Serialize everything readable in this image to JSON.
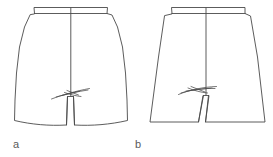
{
  "figure": {
    "type": "technical-flat-line-drawing",
    "background_color": "#ffffff",
    "line_color": "#4a4a4a",
    "line_width": 0.9,
    "width": 273,
    "height": 157
  },
  "diagram_data": {
    "type": "line-drawing",
    "title": "",
    "panels": [
      {
        "id": "a",
        "label": "a",
        "name": "straight-shorts",
        "description": "Shorts with gently curved outward side seams, straight parallel inseams and slightly curved hems",
        "label_x": 13,
        "label_y": 139,
        "outline": "M 34.5 13.5 L 34.0 7.5 L 107.5 7.5 L 107.0 13.5 L 112.0 15.0 L 117.5 27.0 L 122.5 47.0 L 125.5 73.0 L 127.0 100.0 L 127.5 120.5 C 110.0 124.5 92.0 126.0 74.5 125.0 L 73.5 96.5 L 67.5 96.5 L 66.5 125.0 C 49.0 126.0 31.5 124.5 14.5 120.5 L 15.0 100.0 L 16.5 73.0 L 19.5 47.0 L 24.5 27.0 L 30.0 15.0 Z",
        "waistband_line": "M 34.5 13.5 L 107.0 13.5",
        "center_seam": "M 70.8 8.0 L 70.8 96.0",
        "inseam_left": "M 67.5 96.5 L 66.5 125.0",
        "inseam_right": "M 73.5 96.5 L 74.5 125.0",
        "hem_left": "M 14.5 120.5 C 32.0 124.8 49.0 126.2 66.5 125.0",
        "hem_right": "M 74.5 125.0 C 92.0 126.2 110.0 124.8 127.5 120.5",
        "crotch_marks": [
          "M 51.5 99.0 C 62.0 95.0 76.0 91.0 89.5 88.5",
          "M 56.0 97.0 C 66.0 94.0 78.0 91.5 88.0 90.0",
          "M 62.0 95.5 L 80.0 91.0",
          "M 64.5 92.5 C 70.0 94.5 76.0 96.0 81.0 96.5",
          "M 67.0 90.5 L 78.5 95.0"
        ]
      },
      {
        "id": "b",
        "label": "b",
        "name": "a-line-flared-shorts",
        "description": "A-line shorts with straight side seams flaring outward, V-shaped diverging inseams and straight hems",
        "label_x": 135,
        "label_y": 139,
        "outline": "M 172.0 13.5 L 171.5 7.5 L 245.0 7.5 L 245.0 13.5 L 250.5 16.0 L 257.5 57.0 L 265.0 122.0 L 205.5 122.0 L 209.0 95.5 L 203.0 95.5 L 198.5 122.0 L 150.0 122.0 L 158.5 57.0 L 164.5 16.0 Z",
        "waistband_line": "M 172.0 13.5 L 245.0 13.5",
        "center_seam": "M 206.0 8.0 L 206.0 95.0",
        "inseam_left": "M 203.5 95.5 L 198.5 122.0",
        "inseam_right": "M 208.5 95.5 L 205.5 122.0",
        "hem_left": "M 150.0 122.0 L 198.5 122.0",
        "hem_right": "M 205.5 122.0 L 265.0 122.0",
        "crotch_marks": [
          "M 178.5 94.5 C 189.0 90.0 203.0 87.0 216.5 86.5",
          "M 181.0 93.0 C 192.0 89.5 205.0 88.0 215.0 88.5",
          "M 186.0 91.0 L 212.0 88.0",
          "M 188.0 88.0 C 194.0 90.5 201.0 92.5 207.5 93.0",
          "M 191.0 86.5 L 205.0 92.0"
        ]
      }
    ]
  }
}
